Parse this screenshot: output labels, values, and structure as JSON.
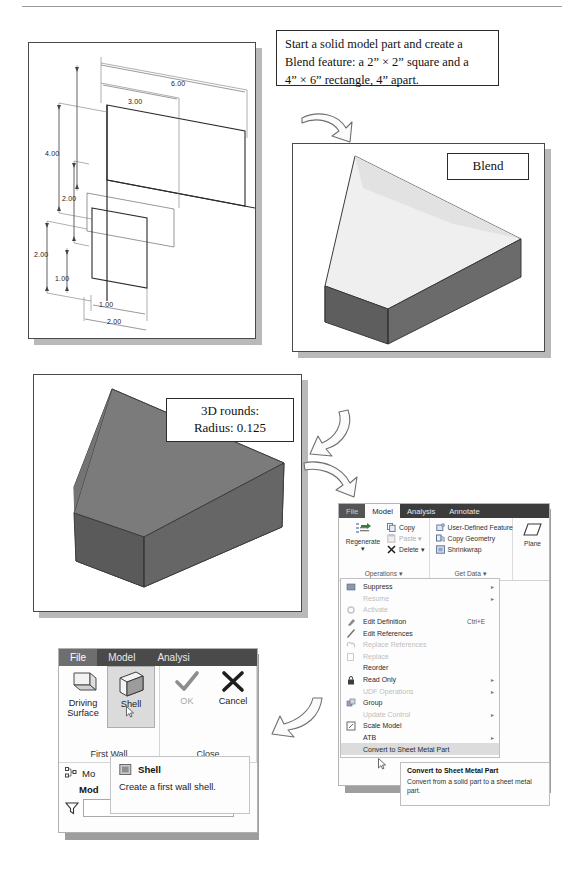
{
  "instruction": {
    "line1": "Start a solid model part and create a",
    "line2": "Blend feature: a 2” × 2” square and a",
    "line3": "4” × 6” rectangle, 4” apart."
  },
  "drawing": {
    "title": "blend-section-dimensions",
    "dimensions": [
      "6.00",
      "3.00",
      "4.00",
      "2.00",
      "2.00",
      "1.00",
      "1.00",
      "2.00"
    ]
  },
  "blend_figure": {
    "label": "Blend"
  },
  "rounds_figure": {
    "label_line1": "3D rounds:",
    "label_line2": "Radius: 0.125"
  },
  "ribbon_right": {
    "tabs": [
      {
        "label": "File",
        "kind": "file"
      },
      {
        "label": "Model",
        "kind": "active"
      },
      {
        "label": "Analysis",
        "kind": "normal"
      },
      {
        "label": "Annotate",
        "kind": "normal"
      }
    ],
    "groups": [
      {
        "title": "Operations ▾",
        "big": {
          "label": "Regenerate\n▾",
          "icon": "regenerate-icon"
        },
        "items": [
          {
            "label": "Copy",
            "icon": "copy-icon",
            "disabled": false
          },
          {
            "label": "Paste  ▾",
            "icon": "paste-icon",
            "disabled": true
          },
          {
            "label": "Delete  ▾",
            "icon": "delete-icon",
            "disabled": false
          }
        ]
      },
      {
        "title": "Get Data ▾",
        "items": [
          {
            "label": "User-Defined Feature",
            "icon": "udf-icon",
            "disabled": false
          },
          {
            "label": "Copy Geometry",
            "icon": "copy-geometry-icon",
            "disabled": false
          },
          {
            "label": "Shrinkwrap",
            "icon": "shrinkwrap-icon",
            "disabled": false
          }
        ]
      },
      {
        "title": "",
        "big": {
          "label": "Plane",
          "icon": "plane-icon"
        }
      }
    ]
  },
  "context_menu": {
    "items": [
      {
        "label": "Suppress",
        "icon": "suppress-icon",
        "disabled": false,
        "submenu": true,
        "shortcut": "",
        "selected": false
      },
      {
        "label": "Resume",
        "icon": "",
        "disabled": true,
        "submenu": true,
        "shortcut": "",
        "selected": false
      },
      {
        "label": "Activate",
        "icon": "activate-icon",
        "disabled": true,
        "submenu": false,
        "shortcut": "",
        "selected": false
      },
      {
        "label": "Edit Definition",
        "icon": "edit-def-icon",
        "disabled": false,
        "submenu": false,
        "shortcut": "Ctrl+E",
        "selected": false
      },
      {
        "label": "Edit References",
        "icon": "edit-ref-icon",
        "disabled": false,
        "submenu": false,
        "shortcut": "",
        "selected": false
      },
      {
        "label": "Replace References",
        "icon": "replace-ref-icon",
        "disabled": true,
        "submenu": false,
        "shortcut": "",
        "selected": false
      },
      {
        "label": "Replace",
        "icon": "replace-icon",
        "disabled": true,
        "submenu": false,
        "shortcut": "",
        "selected": false
      },
      {
        "label": "Reorder",
        "icon": "",
        "disabled": false,
        "submenu": false,
        "shortcut": "",
        "selected": false
      },
      {
        "label": "Read Only",
        "icon": "lock-icon",
        "disabled": false,
        "submenu": true,
        "shortcut": "",
        "selected": false
      },
      {
        "label": "UDF Operations",
        "icon": "",
        "disabled": true,
        "submenu": true,
        "shortcut": "",
        "selected": false
      },
      {
        "label": "Group",
        "icon": "group-icon",
        "disabled": false,
        "submenu": false,
        "shortcut": "",
        "selected": false
      },
      {
        "label": "Update Control",
        "icon": "",
        "disabled": true,
        "submenu": true,
        "shortcut": "",
        "selected": false
      },
      {
        "label": "Scale Model",
        "icon": "scale-model-icon",
        "disabled": false,
        "submenu": false,
        "shortcut": "",
        "selected": false
      },
      {
        "label": "ATB",
        "icon": "",
        "disabled": false,
        "submenu": true,
        "shortcut": "",
        "selected": false
      },
      {
        "label": "Convert to Sheet Metal Part",
        "icon": "",
        "disabled": false,
        "submenu": false,
        "shortcut": "",
        "selected": true
      }
    ]
  },
  "tooltip_right": {
    "title": "Convert to Sheet Metal Part",
    "body": "Convert from a solid part to a sheet metal part."
  },
  "ribbon_left": {
    "tabs": [
      {
        "label": "File",
        "kind": "file"
      },
      {
        "label": "Model",
        "kind": "normal"
      },
      {
        "label": "Analysi",
        "kind": "normal"
      }
    ],
    "groups": [
      {
        "title": "First Wall",
        "buttons": [
          {
            "label": "Driving\nSurface",
            "icon": "driving-surface-icon",
            "state": "normal"
          },
          {
            "label": "Shell",
            "icon": "shell-icon",
            "state": "selected"
          }
        ]
      },
      {
        "title": "Close",
        "buttons": [
          {
            "label": "OK",
            "icon": "check-icon",
            "state": "disabled"
          },
          {
            "label": "Cancel",
            "icon": "x-icon",
            "state": "normal"
          }
        ]
      }
    ],
    "tree": {
      "node_label": "Mo",
      "bold_label": "Mod",
      "search_value": ""
    }
  },
  "tooltip_left": {
    "title": "Shell",
    "body": "Create a first wall shell.",
    "icon": "shell-small-icon"
  }
}
